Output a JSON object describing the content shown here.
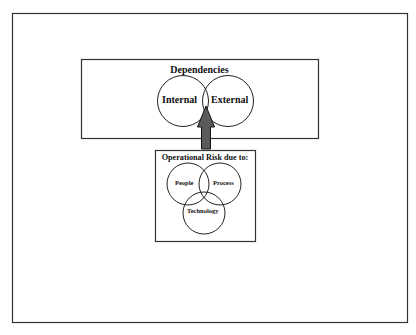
{
  "diagram": {
    "dependencies_box": {
      "title": "Dependencies",
      "circles": [
        {
          "label": "Internal"
        },
        {
          "label": "External"
        }
      ]
    },
    "arrow": {
      "direction": "up",
      "from": "Operational Risk due to:",
      "to": "Dependencies",
      "fill": "#5a5a5a",
      "stroke": "#111111"
    },
    "operational_risk_box": {
      "title": "Operational Risk due to:",
      "circles": [
        {
          "label": "People"
        },
        {
          "label": "Process"
        },
        {
          "label": "Technology"
        }
      ]
    },
    "colors": {
      "background": "#ffffff",
      "frame": "#333333",
      "line": "#222222"
    }
  }
}
